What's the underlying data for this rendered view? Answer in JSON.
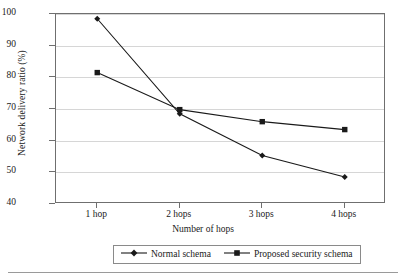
{
  "chart_data": {
    "type": "line",
    "title": "",
    "xlabel": "Number of hops",
    "ylabel": "Network delivery ratio (%)",
    "categories": [
      "1 hop",
      "2 hops",
      "3 hops",
      "4 hops"
    ],
    "yticks": [
      40,
      50,
      60,
      70,
      80,
      90,
      100
    ],
    "ylim": [
      40,
      100
    ],
    "grid": true,
    "legend_position": "bottom-center",
    "series": [
      {
        "name": "Normal schema",
        "marker": "diamond",
        "color": "#1a1a1a",
        "values": [
          98.5,
          68.5,
          55.3,
          48.5
        ]
      },
      {
        "name": "Proposed security schema",
        "marker": "square",
        "color": "#1a1a1a",
        "values": [
          81.5,
          69.8,
          66.0,
          63.5
        ]
      }
    ]
  },
  "axes": {
    "y_title": "Network delivery ratio (%)",
    "x_title": "Number of hops",
    "y_tick_labels": [
      "100",
      "90",
      "80",
      "70",
      "60",
      "50",
      "40"
    ],
    "x_tick_labels": [
      "1 hop",
      "2 hops",
      "3 hops",
      "4 hops"
    ]
  },
  "legend": {
    "items": [
      {
        "label": "Normal schema",
        "marker": "diamond-marker"
      },
      {
        "label": "Proposed security schema",
        "marker": "square-marker"
      }
    ]
  }
}
